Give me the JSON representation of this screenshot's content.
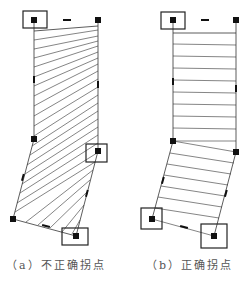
{
  "figure": {
    "panels": [
      {
        "id": "a",
        "caption": "（a）不正确拐点",
        "description": "Strip with diagonal hatching; turning points placed incorrectly",
        "vertices": {
          "top_left": [
            34,
            20
          ],
          "top_right": [
            98,
            20
          ],
          "left_mid": [
            34,
            139
          ],
          "right_mid": [
            98,
            151
          ],
          "bottom_left": [
            13,
            219
          ],
          "bottom_right": [
            76,
            236
          ]
        },
        "highlighted_points": [
          "top_left",
          "right_mid",
          "bottom_right"
        ]
      },
      {
        "id": "b",
        "caption": "（b）正确拐点",
        "description": "Strip with parallel cross lines; turning points placed correctly",
        "vertices": {
          "top_left": [
            173,
            20
          ],
          "top_right": [
            236,
            20
          ],
          "left_mid": [
            173,
            141
          ],
          "right_mid": [
            236,
            152
          ],
          "bottom_left": [
            152,
            219
          ],
          "bottom_right": [
            214,
            236
          ]
        },
        "highlighted_points": [
          "top_left",
          "bottom_left",
          "bottom_right"
        ]
      }
    ],
    "colors": {
      "line": "#333333",
      "marker": "#111111",
      "caption": "#555555"
    }
  }
}
